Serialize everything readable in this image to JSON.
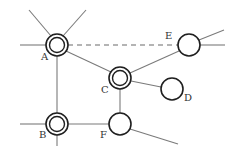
{
  "diagram": {
    "title": "",
    "colors": {
      "edge": "#7a7a7a",
      "node_stroke": "#1f1f1f",
      "label": "#333333",
      "background": "#ffffff"
    },
    "nodes": [
      {
        "id": "A",
        "label": "A",
        "x": 57,
        "y": 45,
        "r": 11,
        "double": true,
        "label_x": 41,
        "label_y": 60
      },
      {
        "id": "B",
        "label": "B",
        "x": 57,
        "y": 124,
        "r": 11,
        "double": true,
        "label_x": 39,
        "label_y": 138
      },
      {
        "id": "C",
        "label": "C",
        "x": 120,
        "y": 78,
        "r": 11,
        "double": true,
        "label_x": 101,
        "label_y": 93
      },
      {
        "id": "D",
        "label": "D",
        "x": 172,
        "y": 89,
        "r": 11,
        "double": false,
        "label_x": 184,
        "label_y": 101
      },
      {
        "id": "E",
        "label": "E",
        "x": 189,
        "y": 45,
        "r": 11,
        "double": false,
        "label_x": 165,
        "label_y": 39
      },
      {
        "id": "F",
        "label": "F",
        "x": 120,
        "y": 124,
        "r": 11,
        "double": false,
        "label_x": 100,
        "label_y": 138
      }
    ],
    "edges": [
      {
        "from": "A",
        "to": "E",
        "style": "dashed",
        "x1": 68,
        "y1": 45,
        "x2": 178,
        "y2": 45
      },
      {
        "from": "A",
        "to": "B",
        "style": "solid",
        "x1": 57,
        "y1": 56,
        "x2": 57,
        "y2": 113
      },
      {
        "from": "A",
        "to": "C",
        "style": "solid",
        "x1": 66,
        "y1": 51,
        "x2": 111,
        "y2": 72
      },
      {
        "from": "C",
        "to": "E",
        "style": "solid",
        "x1": 130,
        "y1": 73,
        "x2": 179,
        "y2": 51
      },
      {
        "from": "C",
        "to": "D",
        "style": "solid",
        "x1": 131,
        "y1": 81,
        "x2": 161,
        "y2": 87
      },
      {
        "from": "C",
        "to": "F",
        "style": "solid",
        "x1": 120,
        "y1": 89,
        "x2": 120,
        "y2": 113
      },
      {
        "from": "B",
        "to": "F",
        "style": "solid",
        "x1": 68,
        "y1": 124,
        "x2": 109,
        "y2": 124
      }
    ],
    "stubs": [
      {
        "node": "A",
        "x1": 51,
        "y1": 36,
        "x2": 29,
        "y2": 10
      },
      {
        "node": "A",
        "x1": 63,
        "y1": 36,
        "x2": 86,
        "y2": 10
      },
      {
        "node": "A",
        "x1": 46,
        "y1": 45,
        "x2": 20,
        "y2": 45
      },
      {
        "node": "B",
        "x1": 46,
        "y1": 124,
        "x2": 20,
        "y2": 124
      },
      {
        "node": "B",
        "x1": 57,
        "y1": 135,
        "x2": 57,
        "y2": 146
      },
      {
        "node": "E",
        "x1": 199,
        "y1": 40,
        "x2": 224,
        "y2": 30
      },
      {
        "node": "E",
        "x1": 200,
        "y1": 45,
        "x2": 225,
        "y2": 45
      },
      {
        "node": "F",
        "x1": 130,
        "y1": 129,
        "x2": 178,
        "y2": 144
      }
    ]
  }
}
